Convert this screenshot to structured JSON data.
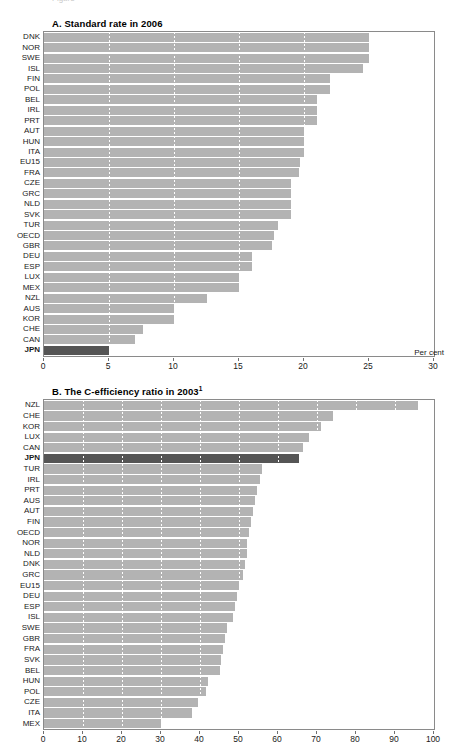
{
  "figure": {
    "clipped_header": "Figure",
    "units_label": "Per cent"
  },
  "chart_data": [
    {
      "type": "bar",
      "orientation": "horizontal",
      "panel_id": "A",
      "title": "A. Standard rate in 2006",
      "xlabel": "Per cent",
      "ylabel": "",
      "xlim": [
        0,
        30
      ],
      "xticks": [
        0,
        5,
        10,
        15,
        20,
        25,
        30
      ],
      "xtick_labels": [
        "0",
        "5",
        "10",
        "15",
        "20",
        "25",
        "30"
      ],
      "grid": true,
      "highlight": "JPN",
      "categories": [
        "DNK",
        "NOR",
        "SWE",
        "ISL",
        "FIN",
        "POL",
        "BEL",
        "IRL",
        "PRT",
        "AUT",
        "HUN",
        "ITA",
        "EU15",
        "FRA",
        "CZE",
        "GRC",
        "NLD",
        "SVK",
        "TUR",
        "OECD",
        "GBR",
        "DEU",
        "ESP",
        "LUX",
        "MEX",
        "NZL",
        "AUS",
        "KOR",
        "CHE",
        "CAN",
        "JPN"
      ],
      "values": [
        25.0,
        25.0,
        25.0,
        24.5,
        22.0,
        22.0,
        21.0,
        21.0,
        21.0,
        20.0,
        20.0,
        20.0,
        19.7,
        19.6,
        19.0,
        19.0,
        19.0,
        19.0,
        18.0,
        17.7,
        17.5,
        16.0,
        16.0,
        15.0,
        15.0,
        12.5,
        10.0,
        10.0,
        7.6,
        7.0,
        5.0
      ]
    },
    {
      "type": "bar",
      "orientation": "horizontal",
      "panel_id": "B",
      "title": "B. The C-efficiency ratio in 2003",
      "title_superscript": "1",
      "xlabel": "",
      "ylabel": "",
      "xlim": [
        0,
        100
      ],
      "xticks": [
        0,
        10,
        20,
        30,
        40,
        50,
        60,
        70,
        80,
        90,
        100
      ],
      "xtick_labels": [
        "0",
        "10",
        "20",
        "30",
        "40",
        "50",
        "60",
        "70",
        "80",
        "90",
        "100"
      ],
      "grid": true,
      "highlight": "JPN",
      "categories": [
        "NZL",
        "CHE",
        "KOR",
        "LUX",
        "CAN",
        "JPN",
        "TUR",
        "IRL",
        "PRT",
        "AUS",
        "AUT",
        "FIN",
        "OECD",
        "NOR",
        "NLD",
        "DNK",
        "GRC",
        "EU15",
        "DEU",
        "ESP",
        "ISL",
        "SWE",
        "GBR",
        "FRA",
        "SVK",
        "BEL",
        "HUN",
        "POL",
        "CZE",
        "ITA",
        "MEX"
      ],
      "values": [
        96.0,
        74.0,
        71.0,
        68.0,
        66.5,
        65.5,
        56.0,
        55.5,
        54.5,
        54.0,
        53.5,
        53.0,
        52.5,
        52.0,
        52.0,
        51.5,
        51.0,
        50.0,
        49.5,
        49.0,
        48.5,
        47.0,
        46.5,
        46.0,
        45.5,
        45.0,
        42.0,
        41.5,
        39.5,
        38.0,
        30.0
      ]
    }
  ]
}
